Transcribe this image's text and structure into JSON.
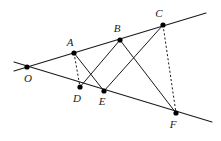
{
  "figure": {
    "kind": "geometry-diagram",
    "background_color": "#ffffff",
    "ink_color": "#1a1a1a",
    "width": 221,
    "height": 141
  },
  "points": [
    {
      "id": "O",
      "label": "O",
      "x": 27,
      "y": 67,
      "label_x": 28,
      "label_y": 79
    },
    {
      "id": "A",
      "label": "A",
      "x": 74,
      "y": 53,
      "label_x": 70,
      "label_y": 43
    },
    {
      "id": "B",
      "label": "B",
      "x": 120,
      "y": 40,
      "label_x": 117,
      "label_y": 29
    },
    {
      "id": "C",
      "label": "C",
      "x": 163,
      "y": 25,
      "label_x": 159,
      "label_y": 14
    },
    {
      "id": "D",
      "label": "D",
      "x": 80,
      "y": 87,
      "label_x": 77,
      "label_y": 99
    },
    {
      "id": "E",
      "label": "E",
      "x": 104,
      "y": 91,
      "label_x": 102,
      "label_y": 102
    },
    {
      "id": "F",
      "label": "F",
      "x": 176,
      "y": 113,
      "label_x": 173,
      "label_y": 125
    }
  ],
  "rays": [
    {
      "id": "upper-ray",
      "name": "ray-O-through-A-B-C",
      "x1": 14,
      "y1": 71,
      "x2": 206,
      "y2": 13
    },
    {
      "id": "lower-ray",
      "name": "ray-O-through-D-E-F",
      "x1": 14,
      "y1": 62,
      "x2": 212,
      "y2": 122
    }
  ],
  "segments": [
    {
      "id": "AE",
      "name": "segment-A-E",
      "from": "A",
      "to": "E",
      "style": "solid"
    },
    {
      "id": "BD",
      "name": "segment-B-D",
      "from": "B",
      "to": "D",
      "style": "solid"
    },
    {
      "id": "BF",
      "name": "segment-B-F",
      "from": "B",
      "to": "F",
      "style": "solid"
    },
    {
      "id": "CE",
      "name": "segment-C-E",
      "from": "C",
      "to": "E",
      "style": "solid"
    },
    {
      "id": "AD",
      "name": "segment-A-D",
      "from": "A",
      "to": "D",
      "style": "dashed"
    },
    {
      "id": "CF",
      "name": "segment-C-F",
      "from": "C",
      "to": "F",
      "style": "dashed"
    }
  ],
  "vertex_dot_radius": 2.6
}
